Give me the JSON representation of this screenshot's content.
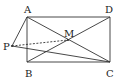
{
  "figure": {
    "type": "geometry-diagram",
    "shape": "rectangle ABCD with diagonals intersecting at M, external point P",
    "points": [
      {
        "name": "A",
        "x": 27,
        "y": 17,
        "label_x": 24,
        "label_y": 13
      },
      {
        "name": "D",
        "x": 110,
        "y": 17,
        "label_x": 105,
        "label_y": 13
      },
      {
        "name": "B",
        "x": 27,
        "y": 62,
        "label_x": 25,
        "label_y": 77
      },
      {
        "name": "C",
        "x": 110,
        "y": 62,
        "label_x": 106,
        "label_y": 77
      },
      {
        "name": "M",
        "x": 68,
        "y": 40,
        "label_x": 64,
        "label_y": 37
      },
      {
        "name": "P",
        "x": 12,
        "y": 46,
        "label_x": 3,
        "label_y": 50
      }
    ],
    "segments": [
      {
        "from": "A",
        "to": "D",
        "style": "solid"
      },
      {
        "from": "D",
        "to": "C",
        "style": "solid"
      },
      {
        "from": "C",
        "to": "B",
        "style": "solid"
      },
      {
        "from": "B",
        "to": "A",
        "style": "solid"
      },
      {
        "from": "A",
        "to": "C",
        "style": "solid"
      },
      {
        "from": "B",
        "to": "D",
        "style": "solid"
      },
      {
        "from": "P",
        "to": "A",
        "style": "solid"
      },
      {
        "from": "P",
        "to": "C",
        "style": "solid"
      },
      {
        "from": "P",
        "to": "M",
        "style": "dashed"
      }
    ],
    "line_color": "#333333"
  }
}
